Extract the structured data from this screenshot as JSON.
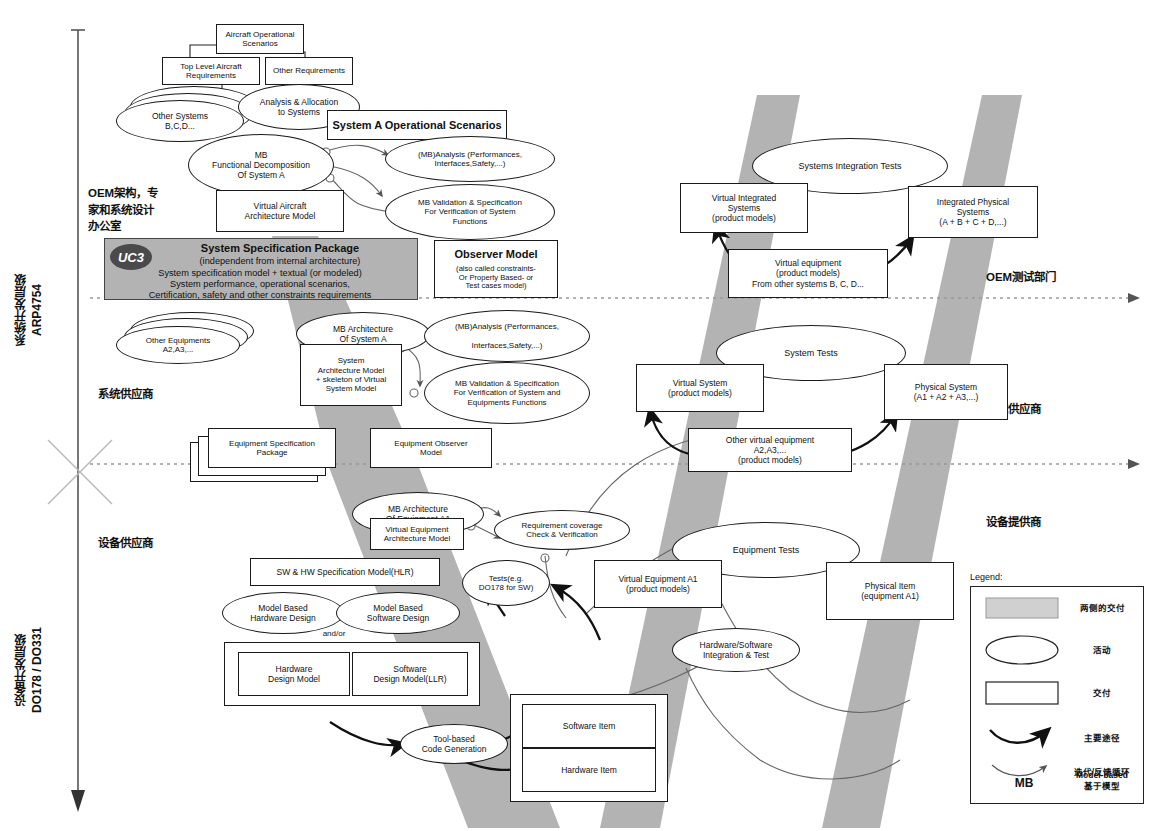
{
  "diagram": {
    "left_axis": {
      "system_level": "系统开发层级\nARP4754",
      "equipment_level": "设备开发层级\nDO178 / DO331"
    },
    "swimlane_labels_left": [
      {
        "id": "oem-design",
        "text": "OEM架构，专\n家和系统设计\n办公室"
      },
      {
        "id": "system-supplier-left",
        "text": "系统供应商"
      },
      {
        "id": "equipment-supplier-left",
        "text": "设备供应商"
      }
    ],
    "swimlane_labels_right": [
      {
        "id": "oem-test",
        "text": "OEM测试部门"
      },
      {
        "id": "system-supplier-right",
        "text": "系统供应商"
      },
      {
        "id": "equipment-provider-right",
        "text": "设备提供商"
      }
    ],
    "nodes": {
      "aircraft_operational_scenarios": "Aircraft Operational\nScenarios",
      "top_level_aircraft_requirements": "Top Level Aircraft\nRequirements",
      "other_requirements": "Other Requirements",
      "other_systems": "Other Systems\nB,C,D...",
      "analysis_allocation_to_systems": "Analysis & Allocation\nto Systems",
      "system_a_operational_scenarios": "System A Operational Scenarios",
      "mb_functional_decomposition": "MB\nFunctional Decomposition\nOf System A",
      "virtual_aircraft_architecture_model": "Virtual Aircraft\nArchitecture Model",
      "mb_analysis_top": "(MB)Analysis (Performances,\nInterfaces,Safety,...)",
      "mb_validation_spec_system_functions": "MB Validation & Specification\nFor Verification of System\nFunctions",
      "observer_model": "Observer Model",
      "observer_model_sub": "(also called constraints-\nOr Property Based- or\nTest cases model)",
      "other_equipments": "Other Equipments\nA2,A3,...",
      "mb_architecture_of_system_a": "MB Architecture\nOf System A",
      "system_architecture_model": "System\nArchitecture Model\n+ skeleton of Virtual\nSystem Model",
      "mb_analysis_mid": "(MB)Analysis (Performances,\n\nInterfaces,Safety,...)",
      "mb_validation_spec_system_equipment": "MB Validation & Specification\nFor Verification of System and\nEquipments Functions",
      "equipment_specification_package": "Equipment Specification\nPackage",
      "equipment_observer_model": "Equipment Observer\nModel",
      "mb_architecture_of_equipment_a1": "MB Architecture\nOf Equipment A1",
      "virtual_equipment_architecture_model": "Virtual Equipment\nArchitecture Model",
      "requirement_coverage_check": "Requirement coverage\nCheck & Verification",
      "sw_hw_specification_model": "SW & HW Specification Model(HLR)",
      "model_based_hardware_design": "Model Based\nHardware Design",
      "model_based_software_design": "Model Based\nSoftware Design",
      "and_or": "and/or",
      "tests_do178": "Tests(e.g.\nDO178 for SW)",
      "hardware_design_model": "Hardware\nDesign Model",
      "software_design_model": "Software\nDesign Model(LLR)",
      "tool_based_code_generation": "Tool-based\nCode Generation",
      "software_item": "Software Item",
      "hardware_item": "Hardware Item",
      "systems_integration_tests": "Systems Integration Tests",
      "virtual_integrated_systems": "Virtual Integrated\nSystems\n(product models)",
      "integrated_physical_systems": "Integrated Physical\nSystems\n(A + B + C + D,...)",
      "virtual_equipment_other_systems": "Virtual equipment\n(product models)\nFrom other systems B, C, D...",
      "system_tests": "System Tests",
      "virtual_system": "Virtual System\n(product models)",
      "physical_system": "Physical System\n(A1 + A2 + A3,...)",
      "other_virtual_equipment": "Other virtual equipment\nA2,A3,...\n(product models)",
      "equipment_tests": "Equipment Tests",
      "virtual_equipment_a1": "Virtual Equipment A1\n(product models)",
      "physical_item_a1": "Physical Item\n(equipment A1)",
      "hardware_software_integration_test": "Hardware/Software\nIntegration & Test"
    },
    "spec_package": {
      "badge": "UC3",
      "line1": "System Specification Package",
      "line2": "(independent from internal architecture)",
      "line3": "System specification model + textual (or modeled)",
      "line4": "System performance, operational scenarios,",
      "line5": "Certification, safety and other constraints requirements"
    },
    "legend": {
      "title": "Legend:",
      "items": [
        {
          "icon": "gray-band-swatch",
          "label": "两侧的交付"
        },
        {
          "icon": "ellipse-swatch",
          "label": "活动"
        },
        {
          "icon": "rectangle-swatch",
          "label": "交付"
        },
        {
          "icon": "thick-arrow-icon",
          "label": "主要途径"
        },
        {
          "icon": "thin-arrow-icon",
          "label": "迭代/反馈循环"
        },
        {
          "icon": "mb-abbrev",
          "label": "Model-based\n基于模型",
          "abbrev": "MB"
        }
      ]
    },
    "colors": {
      "band_gray": "#b3b3b3",
      "spec_fill": "#b3b3b3",
      "uc3_fill": "#4a4a4a",
      "stroke": "#1a1a1a",
      "divider": "#999999"
    }
  }
}
